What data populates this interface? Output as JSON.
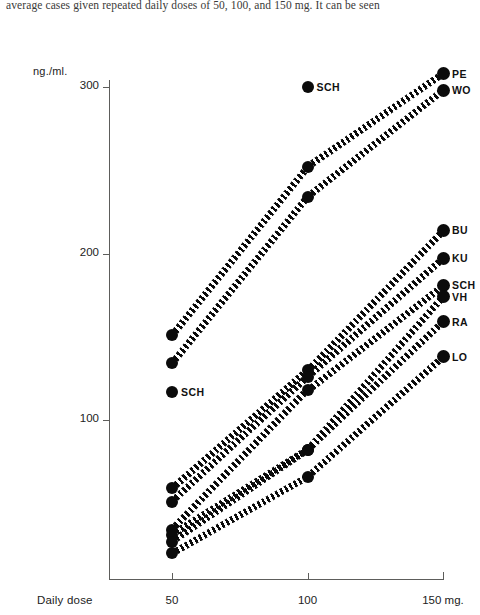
{
  "caption": {
    "text": "average cases given repeated daily doses of 50, 100, and 150 mg. It can be seen"
  },
  "chart_data": {
    "type": "line",
    "title": "",
    "subtitle": "",
    "xlabel": "Daily dose",
    "ylabel": "ng./ml.",
    "x": [
      50,
      100,
      150
    ],
    "xtick_labels": [
      "50",
      "100",
      "150 mg."
    ],
    "ytick_labels": [
      "100",
      "200",
      "300"
    ],
    "yticks": [
      100,
      200,
      300
    ],
    "ylim": [
      0,
      320
    ],
    "xlim": [
      25,
      165
    ],
    "grid": false,
    "legend": "point-labels-at-right",
    "marker": "filled-circle",
    "linestyle": "dotted",
    "series": [
      {
        "name": "PE",
        "label": "PE",
        "values": [
          151,
          252,
          308
        ]
      },
      {
        "name": "WO",
        "label": "WO",
        "values": [
          134,
          234,
          298
        ]
      },
      {
        "name": "BU",
        "label": "BU",
        "values": [
          59,
          130,
          214
        ]
      },
      {
        "name": "KU",
        "label": "KU",
        "values": [
          51,
          126,
          197
        ]
      },
      {
        "name": "SCH",
        "label": "SCH",
        "values": [
          34,
          118,
          181
        ]
      },
      {
        "name": "VH",
        "label": "VH",
        "values": [
          31,
          82,
          174
        ]
      },
      {
        "name": "RA",
        "label": "RA",
        "values": [
          27,
          82,
          159
        ]
      },
      {
        "name": "LO",
        "label": "LO",
        "values": [
          20,
          66,
          138
        ]
      }
    ],
    "unconnected_points": [
      {
        "label": "SCH",
        "x": 100,
        "value": 300
      },
      {
        "label": "SCH",
        "x": 50,
        "value": 117
      }
    ],
    "annotations": [
      "Two outlier SCH points are plotted without connecting lines.",
      "Right-hand labels identify each patient curve at the 150 mg dose."
    ]
  },
  "colors": {
    "ink": "#0b0b0b",
    "axis": "#5d5d5b",
    "background": "#ffffff",
    "caption_text": "#3a3a38"
  }
}
